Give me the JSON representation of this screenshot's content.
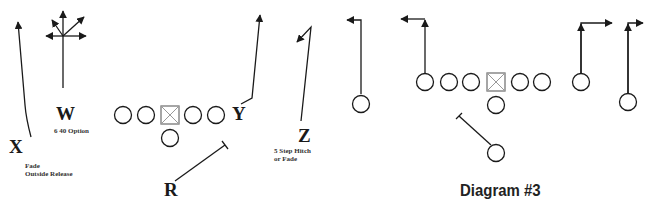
{
  "diagram_left": {
    "players": {
      "x": "X",
      "w": "W",
      "y": "Y",
      "z": "Z",
      "r": "R"
    },
    "notes": {
      "x_line1": "Fade",
      "x_line2": "Outside Release",
      "w": "6 40 Option",
      "z_line1": "5 Step Hitch",
      "z_line2": "or Fade"
    }
  },
  "diagram_right": {
    "caption": "Diagram #3"
  },
  "colors": {
    "ink": "#1a1a1a",
    "center_square": "#888888",
    "background": "#ffffff"
  }
}
